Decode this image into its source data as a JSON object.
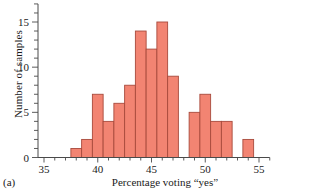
{
  "figure": {
    "panel_label": "(a)",
    "xlabel": "Percentage voting “yes”",
    "ylabel": "Number of samples"
  },
  "chart_data": {
    "type": "bar",
    "title": "",
    "subtitle": "",
    "xlabel": "Percentage voting “yes”",
    "ylabel": "Number of samples",
    "xlim": [
      35,
      56
    ],
    "ylim": [
      0,
      17
    ],
    "grid": false,
    "legend": null,
    "bin_width": 0.5,
    "x_ticks": [
      35,
      40,
      45,
      50,
      55
    ],
    "x_tick_labels": [
      "35",
      "40",
      "45",
      "50",
      "55"
    ],
    "x_minor_tick_step": 1,
    "y_ticks": [
      0,
      5,
      10,
      15
    ],
    "y_tick_labels": [
      "0",
      "5",
      "10",
      "15"
    ],
    "y_minor_tick_step": 1,
    "bar_fill_color": "#F28472",
    "bar_edge_color": "#A84A3C",
    "axis_color": "#4a4a4a",
    "bins": [
      {
        "start": 37.5,
        "end": 38.0,
        "count": 1
      },
      {
        "start": 38.0,
        "end": 38.5,
        "count": 2
      },
      {
        "start": 38.5,
        "end": 39.0,
        "count": 0
      },
      {
        "start": 39.0,
        "end": 39.5,
        "count": 0
      },
      {
        "start": 39.5,
        "end": 40.0,
        "count": 7
      },
      {
        "start": 40.0,
        "end": 40.5,
        "count": 4
      },
      {
        "start": 40.5,
        "end": 41.0,
        "count": 0
      },
      {
        "start": 41.0,
        "end": 41.5,
        "count": 6
      },
      {
        "start": 41.5,
        "end": 42.0,
        "count": 0
      },
      {
        "start": 42.0,
        "end": 42.5,
        "count": 8
      },
      {
        "start": 42.5,
        "end": 43.0,
        "count": 0
      },
      {
        "start": 43.0,
        "end": 43.5,
        "count": 14
      },
      {
        "start": 43.5,
        "end": 44.0,
        "count": 0
      },
      {
        "start": 44.0,
        "end": 44.5,
        "count": 12
      },
      {
        "start": 44.5,
        "end": 45.0,
        "count": 0
      },
      {
        "start": 45.0,
        "end": 45.5,
        "count": 15
      },
      {
        "start": 45.5,
        "end": 46.0,
        "count": 0
      },
      {
        "start": 46.0,
        "end": 46.5,
        "count": 9
      },
      {
        "start": 46.5,
        "end": 48.0,
        "count": 0
      },
      {
        "start": 48.0,
        "end": 49.0,
        "count": 5
      },
      {
        "start": 49.0,
        "end": 50.0,
        "count": 7
      },
      {
        "start": 50.0,
        "end": 51.0,
        "count": 4
      },
      {
        "start": 51.0,
        "end": 52.0,
        "count": 4
      },
      {
        "start": 52.0,
        "end": 53.0,
        "count": 0
      },
      {
        "start": 53.0,
        "end": 54.0,
        "count": 2
      }
    ],
    "bars": [
      {
        "x_left": 37.5,
        "x_right": 38.5,
        "value": 1
      },
      {
        "x_left": 38.5,
        "x_right": 39.5,
        "value": 2
      },
      {
        "x_left": 39.5,
        "x_right": 40.5,
        "value": 7
      },
      {
        "x_left": 40.5,
        "x_right": 41.5,
        "value": 4
      },
      {
        "x_left": 41.5,
        "x_right": 42.5,
        "value": 6
      },
      {
        "x_left": 42.5,
        "x_right": 43.5,
        "value": 8
      },
      {
        "x_left": 43.5,
        "x_right": 44.5,
        "value": 14
      },
      {
        "x_left": 44.5,
        "x_right": 45.5,
        "value": 12
      },
      {
        "x_left": 45.5,
        "x_right": 46.5,
        "value": 15
      },
      {
        "x_left": 46.5,
        "x_right": 47.5,
        "value": 9
      },
      {
        "x_left": 48.5,
        "x_right": 49.5,
        "value": 5
      },
      {
        "x_left": 49.5,
        "x_right": 50.5,
        "value": 7
      },
      {
        "x_left": 50.5,
        "x_right": 51.5,
        "value": 4
      },
      {
        "x_left": 51.5,
        "x_right": 52.5,
        "value": 4
      },
      {
        "x_left": 53.5,
        "x_right": 54.5,
        "value": 2
      }
    ]
  }
}
